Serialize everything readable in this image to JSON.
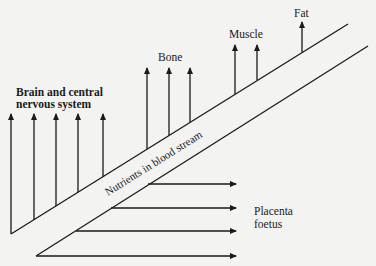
{
  "diagram": {
    "stream_label": "Nutrients in blood stream",
    "targets": {
      "brain": {
        "line1": "Brain and central",
        "line2": "nervous system",
        "arrow_count": 5
      },
      "bone": {
        "label": "Bone",
        "arrow_count": 3
      },
      "muscle": {
        "label": "Muscle",
        "arrow_count": 2
      },
      "fat": {
        "label": "Fat",
        "arrow_count": 1
      },
      "placenta": {
        "line1": "Placenta",
        "line2": "foetus",
        "arrow_count": 4
      }
    },
    "colors": {
      "ink": "#1a1a1a",
      "paper": "#f3f3f1"
    }
  }
}
